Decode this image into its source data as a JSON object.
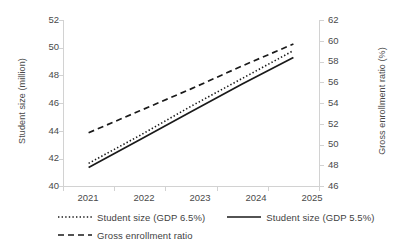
{
  "chart_data": {
    "type": "line",
    "title": "",
    "subtitle": "",
    "xlabel": "",
    "ylabel": "Student size (million)",
    "y2label": "Gross enrollment ratio (%)",
    "categories": [
      "2021",
      "2022",
      "2023",
      "2024",
      "2025"
    ],
    "x_tick_labels": [
      "2021",
      "2022",
      "2023",
      "2024",
      "2025"
    ],
    "y_tick_labels": [
      "40",
      "42",
      "44",
      "46",
      "48",
      "50",
      "52"
    ],
    "y2_tick_labels": [
      "46",
      "48",
      "50",
      "52",
      "54",
      "56",
      "58",
      "60",
      "62"
    ],
    "ylim": [
      40,
      52
    ],
    "y2lim": [
      46,
      62
    ],
    "grid": false,
    "legend_position": "bottom",
    "series": [
      {
        "name": "Student size (GDP 6.5%)",
        "axis": "left",
        "style": "dotted",
        "color": "#1a1a1a",
        "values": [
          41.7,
          43.7,
          45.8,
          47.8,
          49.8
        ]
      },
      {
        "name": "Student size (GDP 5.5%)",
        "axis": "left",
        "style": "solid",
        "color": "#1a1a1a",
        "values": [
          41.4,
          43.4,
          45.4,
          47.4,
          49.3
        ]
      },
      {
        "name": "Gross enrollment ratio",
        "axis": "right",
        "style": "dashed",
        "color": "#1a1a1a",
        "values": [
          51.2,
          53.3,
          55.4,
          57.6,
          59.7
        ]
      }
    ]
  },
  "axes": {
    "left_title": "Student size (million)",
    "right_title": "Gross enrollment ratio (%)"
  },
  "legend": {
    "items": [
      {
        "label": "Student size (GDP 6.5%)",
        "style": "dotted"
      },
      {
        "label": "Student size (GDP 5.5%)",
        "style": "solid"
      },
      {
        "label": "Gross enrollment ratio",
        "style": "dashed"
      }
    ]
  },
  "ticks": {
    "left": [
      "52",
      "50",
      "48",
      "46",
      "44",
      "42",
      "40"
    ],
    "right": [
      "62",
      "60",
      "58",
      "56",
      "54",
      "52",
      "50",
      "48",
      "46"
    ],
    "x": [
      "2021",
      "2022",
      "2023",
      "2024",
      "2025"
    ]
  }
}
